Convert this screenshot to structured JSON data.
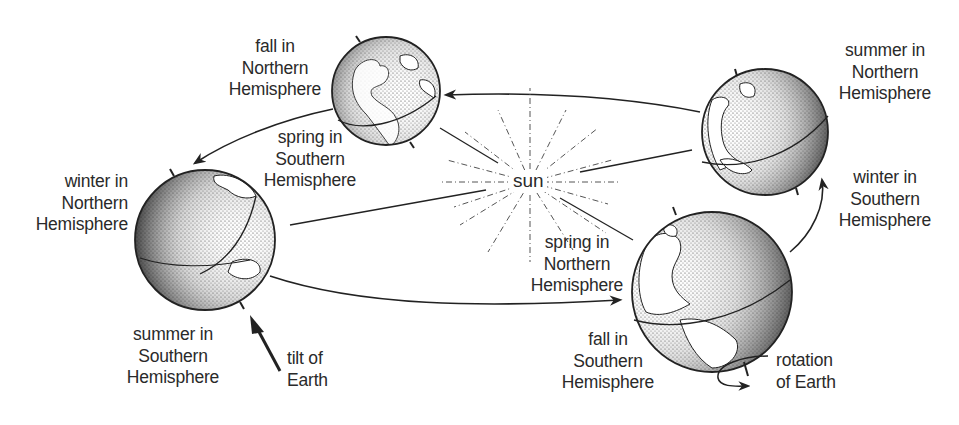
{
  "sun": {
    "label": "sun"
  },
  "globes": [
    {
      "id": "fall-north",
      "position": "top-center",
      "label_lines": [
        "fall in",
        "Northern",
        "Hemisphere"
      ],
      "opposite_label_lines": [
        "spring in",
        "Southern",
        "Hemisphere"
      ]
    },
    {
      "id": "winter-north",
      "position": "left",
      "label_lines": [
        "winter in",
        "Northern",
        "Hemisphere"
      ],
      "opposite_label_lines": [
        "summer in",
        "Southern",
        "Hemisphere"
      ]
    },
    {
      "id": "spring-north",
      "position": "bottom-right",
      "label_lines": [
        "spring in",
        "Northern",
        "Hemisphere"
      ],
      "opposite_label_lines": [
        "fall in",
        "Southern",
        "Hemisphere"
      ]
    },
    {
      "id": "summer-north",
      "position": "top-right",
      "label_lines": [
        "summer in",
        "Northern",
        "Hemisphere"
      ],
      "opposite_label_lines": [
        "winter in",
        "Southern",
        "Hemisphere"
      ]
    }
  ],
  "annotations": {
    "tilt": [
      "tilt of",
      "Earth"
    ],
    "rotation": [
      "rotation",
      "of Earth"
    ]
  },
  "colors": {
    "ink": "#2a2a2a",
    "background": "#ffffff"
  }
}
